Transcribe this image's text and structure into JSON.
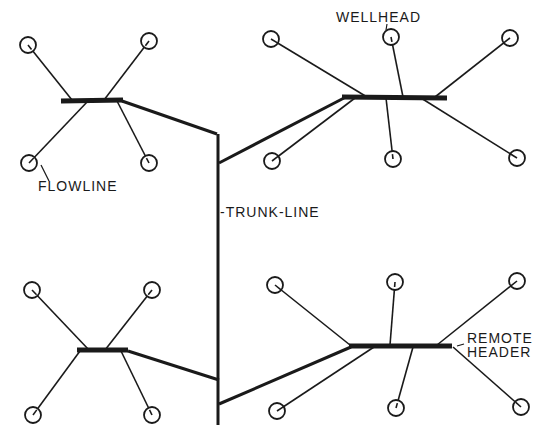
{
  "labels": {
    "wellhead": "WELLHEAD",
    "flowline": "FLOWLINE",
    "trunk_line": "-TRUNK-LINE",
    "remote_header_line1": "REMOTE",
    "remote_header_line2": "HEADER"
  },
  "colors": {
    "line": "#1a1a1a",
    "background": "#ffffff"
  },
  "clusters": [
    {
      "name": "top-left",
      "header": {
        "x1": 61,
        "y1": 101,
        "x2": 123,
        "y2": 100
      },
      "wells": [
        {
          "x": 28,
          "y": 45,
          "hx": 72,
          "hy": 100
        },
        {
          "x": 149,
          "y": 41,
          "hx": 104,
          "hy": 100
        },
        {
          "x": 29,
          "y": 163,
          "hx": 88,
          "hy": 101
        },
        {
          "x": 149,
          "y": 163,
          "hx": 117,
          "hy": 101
        }
      ],
      "trunk_link": [
        [
          122,
          101
        ],
        [
          217,
          134
        ]
      ]
    },
    {
      "name": "top-right",
      "header": {
        "x1": 342,
        "y1": 97,
        "x2": 447,
        "y2": 98
      },
      "wells": [
        {
          "x": 271,
          "y": 39,
          "hx": 367,
          "hy": 97
        },
        {
          "x": 391,
          "y": 37,
          "hx": 403,
          "hy": 97
        },
        {
          "x": 510,
          "y": 38,
          "hx": 435,
          "hy": 97
        },
        {
          "x": 272,
          "y": 161,
          "hx": 355,
          "hy": 98
        },
        {
          "x": 393,
          "y": 159,
          "hx": 386,
          "hy": 98
        },
        {
          "x": 517,
          "y": 158,
          "hx": 421,
          "hy": 98
        }
      ],
      "trunk_link": [
        [
          344,
          98
        ],
        [
          219,
          163
        ]
      ]
    },
    {
      "name": "bottom-left",
      "header": {
        "x1": 77,
        "y1": 350,
        "x2": 128,
        "y2": 350
      },
      "wells": [
        {
          "x": 32,
          "y": 290,
          "hx": 89,
          "hy": 350
        },
        {
          "x": 152,
          "y": 290,
          "hx": 105,
          "hy": 350
        },
        {
          "x": 33,
          "y": 415,
          "hx": 80,
          "hy": 351
        },
        {
          "x": 152,
          "y": 415,
          "hx": 121,
          "hy": 351
        }
      ],
      "trunk_link": [
        [
          128,
          351
        ],
        [
          219,
          380
        ]
      ]
    },
    {
      "name": "bottom-right",
      "header": {
        "x1": 349,
        "y1": 346,
        "x2": 452,
        "y2": 346
      },
      "wells": [
        {
          "x": 275,
          "y": 285,
          "hx": 350,
          "hy": 345
        },
        {
          "x": 395,
          "y": 282,
          "hx": 390,
          "hy": 345
        },
        {
          "x": 517,
          "y": 281,
          "hx": 437,
          "hy": 345
        },
        {
          "x": 277,
          "y": 411,
          "hx": 374,
          "hy": 347
        },
        {
          "x": 396,
          "y": 408,
          "hx": 413,
          "hy": 347
        },
        {
          "x": 521,
          "y": 407,
          "hx": 453,
          "hy": 347
        }
      ],
      "trunk_link": [
        [
          351,
          347
        ],
        [
          219,
          404
        ]
      ]
    }
  ],
  "trunk": {
    "x": 218,
    "y1": 134,
    "y2": 425
  }
}
